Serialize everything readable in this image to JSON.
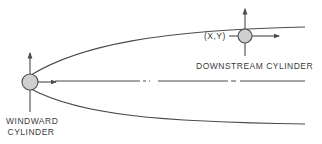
{
  "diagram": {
    "labels": {
      "windward_line1": "WINDWARD",
      "windward_line2": "CYLINDER",
      "downstream": "DOWNSTREAM  CYLINDER",
      "position": "(X,Y)"
    },
    "colors": {
      "line": "#4a4a4a",
      "cylinder_fill": "#cfcfcf",
      "background": "#ffffff"
    },
    "elements": [
      "windward-cylinder",
      "downstream-cylinder",
      "wake-upper-boundary",
      "wake-lower-boundary",
      "centerline"
    ]
  }
}
